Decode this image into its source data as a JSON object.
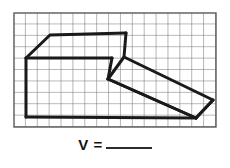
{
  "page": {
    "background_color": "#ffffff",
    "width": 230,
    "height": 168
  },
  "figure": {
    "name": "oblique-prism-on-grid",
    "grid": {
      "x": 14,
      "y": 13,
      "width": 202,
      "height": 114,
      "columns": 17,
      "rows": 10,
      "cell_width": 11.88,
      "cell_height": 11.4,
      "line_color": "#6e6e6e",
      "line_width": 1,
      "border_color": "#5a5a5a",
      "border_width": 1.4,
      "fill_color": "#ffffff"
    },
    "shape": {
      "stroke_color": "#1a1a1a",
      "stroke_width": 3.0,
      "vertices": {
        "top_left_back": [
          50,
          35
        ],
        "left_front": [
          26,
          58
        ],
        "left_bottom": [
          26,
          117
        ],
        "apex_top": [
          126,
          33
        ],
        "mid_junction": [
          124,
          57
        ],
        "inner_front": [
          112,
          58
        ],
        "lower_left_edge": [
          108,
          79
        ],
        "right_vertex": [
          213,
          100
        ],
        "bottom_right": [
          196,
          118
        ],
        "bottom_line_end": [
          196,
          118
        ]
      },
      "paths": [
        "M26,58 L50,35 L126,33",
        "M26,58 L112,58",
        "M26,58 L26,117",
        "M26,117 L196,118",
        "M126,33 L124,57 L108,79",
        "M112,58 L108,79",
        "M124,57 L213,100",
        "M108,79 L196,118",
        "M213,100 L196,118"
      ]
    }
  },
  "answer": {
    "label": "V =",
    "blank_value": "",
    "name": "volume-answer-blank"
  }
}
